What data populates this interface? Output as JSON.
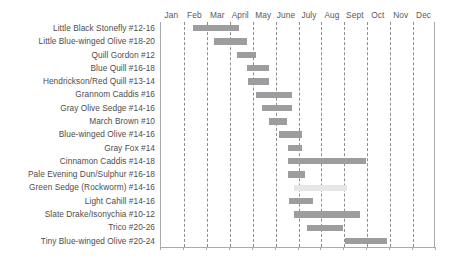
{
  "chart_data": {
    "type": "bar",
    "title": "",
    "subtitle": "",
    "xlabel": "",
    "ylabel": "",
    "orientation": "horizontal",
    "style": "gantt-range",
    "grid": true,
    "legend": false,
    "x_axis_type": "month-of-year",
    "xlim": [
      0,
      12
    ],
    "categories": [
      "Jan",
      "Feb",
      "Mar",
      "April",
      "May",
      "June",
      "July",
      "Aug",
      "Sept",
      "Oct",
      "Nov",
      "Dec"
    ],
    "series_label": "Hatch period",
    "row_labels": [
      "Little Black Stonefly #12-16",
      "Little Blue-winged Olive #18-20",
      "Quill Gordon #12",
      "Blue Quill #16-18",
      "Hendrickson/Red Quill #13-14",
      "Grannom Caddis #16",
      "Gray Olive Sedge #14-16",
      "March Brown #10",
      "Blue-winged Olive #14-16",
      "Gray Fox #14",
      "Cinnamon Caddis #14-18",
      "Pale Evening Dun/Sulphur #16-18",
      "Green Sedge (Rockworm) #14-16",
      "Light Cahill #14-16",
      "Slate Drake/Isonychia #10-12",
      "Trico #20-26",
      "Tiny Blue-winged Olive #20-24"
    ],
    "bars": [
      {
        "label": "Little Black Stonefly #12-16",
        "start_month": 1.4,
        "end_month": 3.4,
        "shade": "normal"
      },
      {
        "label": "Little Blue-winged Olive #18-20",
        "start_month": 2.3,
        "end_month": 3.75,
        "shade": "normal"
      },
      {
        "label": "Quill Gordon #12",
        "start_month": 3.3,
        "end_month": 4.15,
        "shade": "normal"
      },
      {
        "label": "Blue Quill #16-18",
        "start_month": 3.75,
        "end_month": 4.7,
        "shade": "normal"
      },
      {
        "label": "Hendrickson/Red Quill #13-14",
        "start_month": 3.8,
        "end_month": 4.7,
        "shade": "normal"
      },
      {
        "label": "Grannom Caddis #16",
        "start_month": 4.15,
        "end_month": 5.7,
        "shade": "normal"
      },
      {
        "label": "Gray Olive Sedge #14-16",
        "start_month": 4.4,
        "end_month": 5.7,
        "shade": "normal"
      },
      {
        "label": "March Brown #10",
        "start_month": 4.7,
        "end_month": 5.5,
        "shade": "normal"
      },
      {
        "label": "Blue-winged Olive #14-16",
        "start_month": 5.15,
        "end_month": 6.15,
        "shade": "normal"
      },
      {
        "label": "Gray Fox #14",
        "start_month": 5.55,
        "end_month": 6.15,
        "shade": "normal"
      },
      {
        "label": "Cinnamon Caddis #14-18",
        "start_month": 5.55,
        "end_month": 8.95,
        "shade": "normal"
      },
      {
        "label": "Pale Evening Dun/Sulphur #16-18",
        "start_month": 5.55,
        "end_month": 6.3,
        "shade": "normal"
      },
      {
        "label": "Green Sedge (Rockworm) #14-16",
        "start_month": 5.8,
        "end_month": 8.1,
        "shade": "light"
      },
      {
        "label": "Light Cahill #14-16",
        "start_month": 5.6,
        "end_month": 6.65,
        "shade": "normal"
      },
      {
        "label": "Slate Drake/Isonychia #10-12",
        "start_month": 5.8,
        "end_month": 8.7,
        "shade": "normal"
      },
      {
        "label": "Trico #20-26",
        "start_month": 6.35,
        "end_month": 7.95,
        "shade": "normal"
      },
      {
        "label": "Tiny Blue-winged Olive #20-24",
        "start_month": 8.05,
        "end_month": 9.85,
        "shade": "normal"
      }
    ],
    "colors": {
      "bar_normal": "#9d9d9f",
      "bar_light": "#e6e6e6",
      "gridline": "#8d8d90",
      "axis": "#aaaaac",
      "label_text": "#4d4d4f",
      "header_text": "#58585a",
      "background": "#ffffff"
    }
  }
}
